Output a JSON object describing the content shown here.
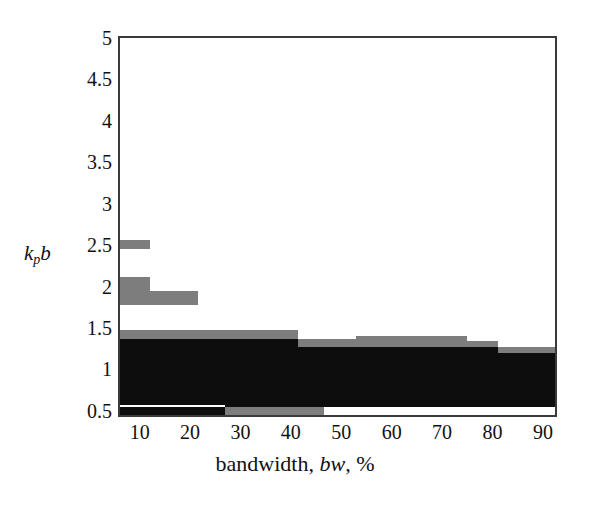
{
  "chart_data": {
    "type": "area",
    "title": "",
    "xlabel": "bandwidth, bw, %",
    "ylabel": "kpb",
    "ylabel_parts": {
      "main": "k",
      "sub": "p",
      "tail": "b"
    },
    "xlim": [
      6.1,
      92.4
    ],
    "ylim": [
      0.45,
      5.0
    ],
    "grid": false,
    "legend": null,
    "xticks": [
      10,
      20,
      30,
      40,
      50,
      60,
      70,
      80,
      90
    ],
    "xtick_labels": [
      "10",
      "20",
      "30",
      "40",
      "50",
      "60",
      "70",
      "80",
      "90"
    ],
    "yticks": [
      0.5,
      1,
      1.5,
      2,
      2.5,
      3,
      3.5,
      4,
      4.5,
      5
    ],
    "ytick_labels": [
      "0.5",
      "1",
      "1.5",
      "2",
      "2.5",
      "3",
      "3.5",
      "4",
      "4.5",
      "5"
    ],
    "series": [
      {
        "name": "gray-band-upper-1",
        "color": "#7d7d7d",
        "segments": [
          {
            "x0": 6.1,
            "x1": 12.0,
            "y0": 2.45,
            "y1": 2.56
          }
        ]
      },
      {
        "name": "gray-band-upper-2",
        "color": "#7d7d7d",
        "segments": [
          {
            "x0": 6.1,
            "x1": 12.0,
            "y0": 1.78,
            "y1": 2.11
          },
          {
            "x0": 12.0,
            "x1": 21.5,
            "y0": 1.78,
            "y1": 1.95
          }
        ]
      },
      {
        "name": "gray-band-main",
        "color": "#7d7d7d",
        "segments": [
          {
            "x0": 6.1,
            "x1": 41.5,
            "y0": 1.37,
            "y1": 1.48
          },
          {
            "x0": 41.5,
            "x1": 53.0,
            "y0": 1.27,
            "y1": 1.37
          },
          {
            "x0": 53.0,
            "x1": 75.0,
            "y0": 1.27,
            "y1": 1.4
          },
          {
            "x0": 75.0,
            "x1": 81.0,
            "y0": 1.27,
            "y1": 1.34
          },
          {
            "x0": 81.0,
            "x1": 92.4,
            "y0": 1.2,
            "y1": 1.27
          }
        ]
      },
      {
        "name": "black-band-main",
        "color": "#0d0d0d",
        "segments": [
          {
            "x0": 6.1,
            "x1": 41.5,
            "y0": 0.45,
            "y1": 1.37
          },
          {
            "x0": 41.5,
            "x1": 53.0,
            "y0": 0.45,
            "y1": 1.27
          },
          {
            "x0": 53.0,
            "x1": 75.0,
            "y0": 0.45,
            "y1": 1.27
          },
          {
            "x0": 75.0,
            "x1": 81.0,
            "y0": 0.45,
            "y1": 1.27
          },
          {
            "x0": 81.0,
            "x1": 92.4,
            "y0": 0.45,
            "y1": 1.2
          }
        ]
      },
      {
        "name": "bottom-white-strip",
        "color": "#ffffff",
        "segments": [
          {
            "x0": 6.1,
            "x1": 27.0,
            "y0": 0.545,
            "y1": 0.575
          }
        ]
      },
      {
        "name": "bottom-gray-strip",
        "color": "#7d7d7d",
        "segments": [
          {
            "x0": 27.0,
            "x1": 46.5,
            "y0": 0.45,
            "y1": 0.545
          }
        ]
      },
      {
        "name": "bottom-white-strip-right",
        "color": "#ffffff",
        "segments": [
          {
            "x0": 46.5,
            "x1": 92.4,
            "y0": 0.45,
            "y1": 0.545
          }
        ]
      }
    ]
  },
  "axes": {
    "x_title_pre": "bandwidth, ",
    "x_title_ital": "bw",
    "x_title_post": ", %",
    "y_title_main": "k",
    "y_title_sub": "p",
    "y_title_tail": "b"
  }
}
